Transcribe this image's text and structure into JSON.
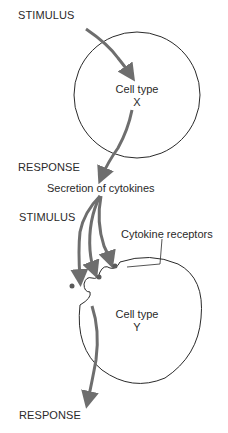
{
  "diagram": {
    "type": "cell-signaling-flow",
    "top": {
      "stimulus_label": "STIMULUS",
      "cell_label": "Cell type",
      "cell_id": "X",
      "response_label": "RESPONSE"
    },
    "middle": {
      "secretion_label": "Secretion of cytokines"
    },
    "bottom": {
      "stimulus_label": "STIMULUS",
      "receptors_label": "Cytokine receptors",
      "cell_label": "Cell type",
      "cell_id": "Y",
      "response_label": "RESPONSE"
    },
    "colors": {
      "arrow": "#6e6e6e",
      "outline": "#2a2a2a",
      "dot": "#5a5a5a",
      "background": "#ffffff"
    }
  }
}
